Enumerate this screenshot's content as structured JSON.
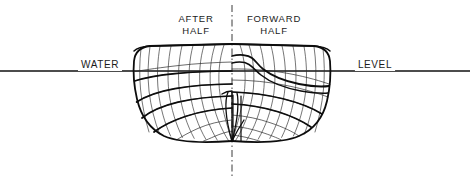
{
  "diagram": {
    "kind": "ship-body-plan",
    "canvas": {
      "width": 470,
      "height": 185,
      "background": "#ffffff"
    },
    "ink_color": "#111111",
    "thin_color": "#2b2b2b"
  },
  "labels": {
    "water": "WATER",
    "level": "LEVEL",
    "after_half_line1": "AFTER",
    "after_half_line2": "HALF",
    "forward_half_line1": "FORWARD",
    "forward_half_line2": "HALF"
  },
  "label_positions": {
    "water": {
      "x": 100,
      "y": 68,
      "anchor": "middle"
    },
    "level": {
      "x": 375,
      "y": 68,
      "anchor": "middle"
    },
    "after_half_line1": {
      "x": 196,
      "y": 22,
      "anchor": "middle"
    },
    "after_half_line2": {
      "x": 196,
      "y": 34,
      "anchor": "middle"
    },
    "forward_half_line1": {
      "x": 274,
      "y": 22,
      "anchor": "middle"
    },
    "forward_half_line2": {
      "x": 274,
      "y": 34,
      "anchor": "middle"
    }
  },
  "geometry": {
    "waterline": {
      "y": 71,
      "x1": 0,
      "x2": 470,
      "width": 1.6
    },
    "centerline": {
      "x": 232,
      "y1": 5,
      "y2": 177,
      "width": 1.0,
      "dash": "7,3,1.5,3"
    },
    "hull_bounds": {
      "left": 133,
      "right": 333,
      "deck_y": 44,
      "keel_y": 142
    },
    "keel_point": {
      "x": 232,
      "y": 141
    },
    "after_outline": "M 232 44 L 150 46 C 141 47 135 52 134 61 C 133 72 134 86 137 99 C 141 116 150 129 164 136 C 180 143 205 143 232 141",
    "after_deck": "M 232 44 L 150 46 C 143 46.5 137 48 134 51",
    "forward_outline": "M 232 44 L 314 46 C 323 47 329 52 330 61 C 331 73 330 88 327 101 C 323 118 313 130 299 136 C 283 143 259 143 232 141",
    "forward_deck": "M 232 44 L 314 46 C 321 46.5 327 48 330 51",
    "forward_knuckle": "M 232 56 C 240 54 248 55 252 58 C 256 61 258 65 263 69 C 272 76 284 81 299 84 C 312 86.5 322 87 329 86",
    "forward_knuckle2": "M 232 63 C 239 61.5 245 62 249 64.5 C 253 67 256 71 261 75 C 271 83 285 88 301 91 C 313 93 323 93.5 328 93",
    "after_stations": [
      "M 141 48.6 C 139.5 61 139.2 76 140.6 90 C 142 104 145 119 149 132",
      "M 150 46.6 C 148 60 147.4 76 149 91 C 150.8 106 154.4 121 159.6 134",
      "M 160 46.3 C 157.6 59.6 156.6 76 158.4 92 C 160.4 108 164.6 123 170.6 136",
      "M 171 46.1 C 168.2 59.3 167 76 169 92.6 C 171.2 109 175.8 124 182.4 137.4",
      "M 182 45.8 C 178.8 59 177.4 76 179.6 93.2 C 182 110 187 125 194.2 138.4",
      "M 193 45.6 C 189.4 58.8 187.8 76 190.2 93.8 C 192.8 111 198.2 126 205.8 139.2",
      "M 204 45.3 C 200 58.5 198.2 76 200.8 94.4 C 203.6 112 209.4 127.4 217.2 140",
      "M 215 45.1 C 210.6 58.3 208.6 76 211.4 95 C 214.4 113 220.6 128.4 228.6 140.8",
      "M 224 45 C 219.4 58.2 217.2 76.4 220.2 95.6 C 223 113 228.4 129 231.6 141"
    ],
    "forward_stations": [
      "M 323 48.6 C 324.5 61 324.8 76 323.4 90 C 322 104 319 119 315 132",
      "M 314 46.6 C 316 60 316.6 76 315 91 C 313.2 106 309.6 121 304.4 134",
      "M 304 46.3 C 306.4 59.6 307.4 76 305.6 92 C 303.6 108 299.4 123 293.4 136",
      "M 293 46.1 C 295.8 59.3 297 76 295 92.6 C 292.8 109 288.2 124 281.6 137.4",
      "M 282 45.8 C 285.2 59 286.6 76 284.4 93.2 C 282 110 277 125 269.8 138.4",
      "M 271 45.6 C 274.6 58.8 276.2 76 273.8 93.8 C 271.2 111 265.8 126 258.2 139.2",
      "M 260 45.3 C 264 58.5 265.8 76 263.2 94.4 C 260.4 112 254.6 127.4 246.8 140",
      "M 249 45.1 C 253.4 58.3 255.4 76 252.6 95 C 249.6 113 243.4 128.4 235.4 140.8",
      "M 240 45 C 244.6 58.2 246.8 76.4 243.8 95.6 C 241 113 235.6 129 232.4 141"
    ],
    "after_waterlines": [
      "M 232 62 C 215 62.4 195 63.6 178 65.6 C 162 67.4 146 69.6 135 71.6",
      "M 232 71 C 214 71.2 193 72 175 73.6 C 158 75.2 144 78 134.6 81",
      "M 232 84 C 212 84.2 192 85.6 175 88.6 C 158 91.6 145 96.6 136.6 102",
      "M 232 96 C 213 96.4 194 98.4 178 102.2 C 162 106 150 111.6 142 118",
      "M 232 108 C 216 108.8 200 111.6 186 116.2 C 172.6 120.6 162 126 154 132",
      "M 232 120 C 220 121 208 124 198 128.4 C 189 132.4 182 136.4 177 139.6",
      "M 232 131 C 226 132 220 134 215 136.2 C 210.4 138.2 206.4 140 203.6 141"
    ],
    "forward_waterlines": [
      "M 232 69 C 250 68.6 272 70.4 290 73.8 C 307 77 322 81.4 330 84.4",
      "M 232 80 C 250 80 270 82 287 85.6 C 304 89 319 93.6 328 97",
      "M 232 92 C 249 92.4 267 94.8 283 98.8 C 299 102.8 313 108.4 322 114",
      "M 232 104 C 248 104.6 264 107.4 278 111.8 C 292 116.2 303 121.6 311 127",
      "M 232 115 C 246 116 259 118.8 271 123 C 283 127 292.6 131.6 299 136",
      "M 232 126 C 243 127 253 129.4 262 132.4 C 270 135 277 137.8 281 139.8",
      "M 232 135 C 239 135.8 245 137 250 138.4 C 254.6 139.6 258 140.6 260 141.2"
    ],
    "after_heavy": [
      "M 232 71 C 214 71.2 193 72 175 73.6 C 158 75.2 144 78 134.6 81",
      "M 232 84 C 212 84.2 192 85.6 175 88.6 C 158 91.6 145 96.6 136.6 102",
      "M 232 96 C 213 96.4 194 98.4 178 102.2 C 162 106 150 111.6 142 118",
      "M 232 108 C 216 108.8 200 111.6 186 116.2 C 172.6 120.6 162 126 154 132"
    ],
    "forward_heavy": [
      "M 232 92 C 249 92.4 267 94.8 283 98.8 C 299 102.8 313 108.4 322 114",
      "M 232 104 C 248 104.6 264 107.4 278 111.8 C 292 116.2 303 121.6 311 127"
    ],
    "keel_fan": [
      "M 232 141 C 229 131 226.6 120 226 110 C 225.6 102 226.4 96 228 92",
      "M 232 141 C 234.6 131.6 236.8 121 237.6 111 C 238.2 103 238 97 237 93",
      "M 232 141 L 232 92",
      "M 232 141 C 236 133 240 126 244 120"
    ],
    "rudder_post": "M 233 95 L 233 141 M 241 96 L 241 141",
    "stern_detail": "M 222 94 C 225 92 228.6 91 232 91"
  }
}
